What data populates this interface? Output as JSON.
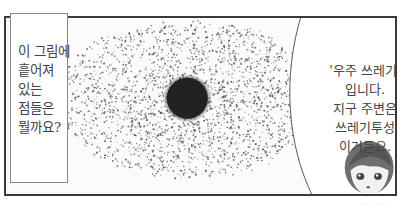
{
  "panel": {
    "caption_box": {
      "lines": [
        "이 그림에",
        "흩어져",
        "있는",
        "점들은",
        "뭘까요?"
      ]
    },
    "speech_bubble": {
      "lines": [
        "'우주 쓰레기'",
        "입니다.",
        "지구 주변은",
        "쓰레기투성",
        "이거든요."
      ]
    },
    "illustration": {
      "subject": "Earth surrounded by scattered space debris dots",
      "center_color": "#262626",
      "dot_color": "#555555"
    },
    "character": "short-haired girl head, bottom right"
  },
  "credit": "····· ·····"
}
